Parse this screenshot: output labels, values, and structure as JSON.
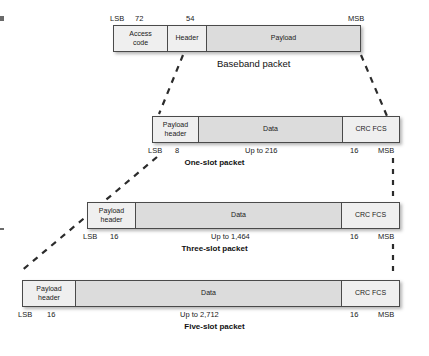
{
  "figure": {
    "endpoint_labels": {
      "lsb": "LSB",
      "msb": "MSB"
    }
  },
  "packets": [
    {
      "id": "baseband",
      "caption": "Baseband packet",
      "caption_style": "plain",
      "fields": [
        {
          "name": "access-code",
          "label": "Access\ncode",
          "label_line1": "Access",
          "label_line2": "code",
          "size_label": "72"
        },
        {
          "name": "header",
          "label": "Header",
          "label_line1": "Header",
          "label_line2": "",
          "size_label": "54"
        },
        {
          "name": "payload",
          "label": "Payload",
          "label_line1": "Payload",
          "label_line2": "",
          "size_label": ""
        }
      ],
      "ticks": [
        {
          "text": "LSB"
        },
        {
          "text": "72"
        },
        {
          "text": "54"
        },
        {
          "text": "MSB"
        }
      ]
    },
    {
      "id": "one-slot",
      "caption": "One-slot packet",
      "caption_style": "bold",
      "fields": [
        {
          "name": "payload-header",
          "label_line1": "Payload",
          "label_line2": "header",
          "size_label": "8"
        },
        {
          "name": "data",
          "label_line1": "Data",
          "label_line2": "",
          "size_label": "Up to 216"
        },
        {
          "name": "crc-fcs",
          "label_line1": "CRC FCS",
          "label_line2": "",
          "size_label": "16"
        }
      ],
      "ticks": [
        {
          "text": "LSB"
        },
        {
          "text": "8"
        },
        {
          "text": "Up to 216"
        },
        {
          "text": "16"
        },
        {
          "text": "MSB"
        }
      ]
    },
    {
      "id": "three-slot",
      "caption": "Three-slot packet",
      "caption_style": "bold",
      "fields": [
        {
          "name": "payload-header",
          "label_line1": "Payload",
          "label_line2": "header",
          "size_label": "16"
        },
        {
          "name": "data",
          "label_line1": "Data",
          "label_line2": "",
          "size_label": "Up to 1,464"
        },
        {
          "name": "crc-fcs",
          "label_line1": "CRC FCS",
          "label_line2": "",
          "size_label": "16"
        }
      ],
      "ticks": [
        {
          "text": "LSB"
        },
        {
          "text": "16"
        },
        {
          "text": "Up to 1,464"
        },
        {
          "text": "16"
        },
        {
          "text": "MSB"
        }
      ]
    },
    {
      "id": "five-slot",
      "caption": "Five-slot packet",
      "caption_style": "bold",
      "fields": [
        {
          "name": "payload-header",
          "label_line1": "Payload",
          "label_line2": "header",
          "size_label": "16"
        },
        {
          "name": "data",
          "label_line1": "Data",
          "label_line2": "",
          "size_label": "Up to 2,712"
        },
        {
          "name": "crc-fcs",
          "label_line1": "CRC FCS",
          "label_line2": "",
          "size_label": "16"
        }
      ],
      "ticks": [
        {
          "text": "LSB"
        },
        {
          "text": "16"
        },
        {
          "text": "Up to 2,712"
        },
        {
          "text": "16"
        },
        {
          "text": "MSB"
        }
      ]
    }
  ],
  "colors": {
    "box_border": "#4a4a4a",
    "fill_light": "#efefef",
    "fill_shade": "#dcdcdc",
    "text": "#1a1a1a",
    "dash": "#2b2b2b"
  }
}
